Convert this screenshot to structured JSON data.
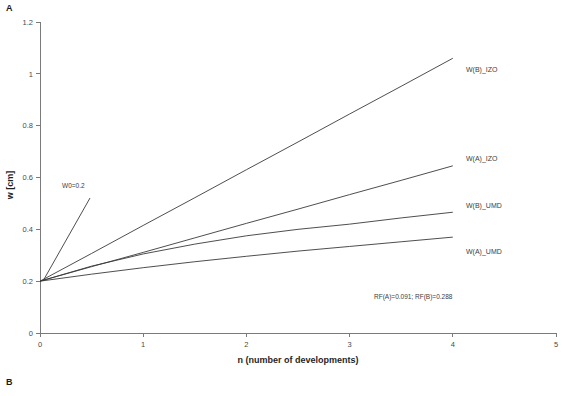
{
  "figure": {
    "panel_a_letter": "A",
    "panel_b_letter": "B"
  },
  "chart_data": {
    "type": "line",
    "title": "",
    "xlabel": "n (number of developments)",
    "ylabel": "w [cm]",
    "xlim": [
      0,
      5
    ],
    "ylim": [
      0,
      1.2
    ],
    "xticks": [
      "0",
      "1",
      "2",
      "3",
      "4",
      "5"
    ],
    "xtick_values": [
      0,
      1,
      2,
      3,
      4,
      5
    ],
    "yticks": [
      "0",
      "0.2",
      "0.4",
      "0.6",
      "0.8",
      "1",
      "1.2"
    ],
    "ytick_values": [
      0,
      0.2,
      0.4,
      0.6,
      0.8,
      1,
      1.2
    ],
    "grid": false,
    "legend_position": "inline-right-of-curve-ends",
    "x": [
      0,
      0.5,
      1,
      1.5,
      2,
      2.5,
      3,
      3.5,
      4
    ],
    "series": [
      {
        "name": "W(B)_IZO",
        "label": "W(B)_IZO",
        "values": [
          0.2,
          0.307,
          0.415,
          0.522,
          0.63,
          0.737,
          0.845,
          0.952,
          1.06
        ]
      },
      {
        "name": "W(A)_IZO",
        "label": "W(A)_IZO",
        "values": [
          0.2,
          0.256,
          0.311,
          0.367,
          0.423,
          0.478,
          0.534,
          0.589,
          0.645
        ]
      },
      {
        "name": "W(B)_UMD",
        "label": "W(B)_UMD",
        "values": [
          0.2,
          0.258,
          0.305,
          0.343,
          0.375,
          0.4,
          0.42,
          0.444,
          0.466
        ]
      },
      {
        "name": "W(A)_UMD",
        "label": "W(A)_UMD",
        "values": [
          0.2,
          0.227,
          0.252,
          0.275,
          0.296,
          0.316,
          0.334,
          0.352,
          0.37
        ]
      }
    ],
    "annotations": [
      {
        "name": "w0-annotation",
        "text": "W0=0.2",
        "x": 0.0,
        "y": 0.2
      },
      {
        "name": "rf-annotation",
        "text": "RF(A)=0.091; RF(B)=0.288",
        "x": 3.1,
        "y": 0.12
      }
    ],
    "colors": {
      "line": "#3a3a3a",
      "axis": "#7a7a7a",
      "text": "#3d3d3d",
      "background": "#ffffff"
    }
  }
}
